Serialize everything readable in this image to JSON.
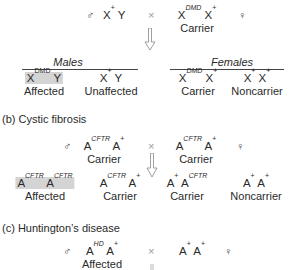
{
  "panel_a": {
    "male_symbol": "♂",
    "female_symbol": "♀",
    "cross": "×",
    "father": {
      "base1": "X",
      "sup1": "+",
      "base2": "Y",
      "sup2": ""
    },
    "mother": {
      "base1": "X",
      "sup1": "DMD",
      "base2": "X",
      "sup2": "+",
      "label": "Carrier"
    },
    "males_header": "Males",
    "females_header": "Females",
    "offspring": [
      {
        "base1": "X",
        "sup1": "DMD",
        "base2": "Y",
        "sup2": "",
        "label": "Affected",
        "highlighted": true
      },
      {
        "base1": "X",
        "sup1": "+",
        "base2": "Y",
        "sup2": "",
        "label": "Unaffected",
        "highlighted": false
      },
      {
        "base1": "X",
        "sup1": "DMD",
        "base2": "X",
        "sup2": "+",
        "label": "Carrier",
        "highlighted": false
      },
      {
        "base1": "X",
        "sup1": "+",
        "base2": "X",
        "sup2": "+",
        "label": "Noncarrier",
        "highlighted": false
      }
    ]
  },
  "panel_b": {
    "title": "(b) Cystic fibrosis",
    "male_symbol": "♂",
    "female_symbol": "♀",
    "cross": "×",
    "father": {
      "base1": "A",
      "sup1": "CFTR",
      "base2": "A",
      "sup2": "+",
      "label": "Carrier"
    },
    "mother": {
      "base1": "A",
      "sup1": "CFTR",
      "base2": "A",
      "sup2": "+",
      "label": "Carrier"
    },
    "offspring": [
      {
        "base1": "A",
        "sup1": "CFTR",
        "base2": "A",
        "sup2": "CFTR",
        "label": "Affected",
        "highlighted": true
      },
      {
        "base1": "A",
        "sup1": "CFTR",
        "base2": "A",
        "sup2": "+",
        "label": "Carrier",
        "highlighted": false
      },
      {
        "base1": "A",
        "sup1": "+",
        "base2": "A",
        "sup2": "CFTR",
        "label": "Carrier",
        "highlighted": false
      },
      {
        "base1": "A",
        "sup1": "+",
        "base2": "A",
        "sup2": "+",
        "label": "Noncarrier",
        "highlighted": false
      }
    ]
  },
  "panel_c": {
    "title": "(c) Huntington’s disease",
    "male_symbol": "♂",
    "female_symbol": "♀",
    "cross": "×",
    "father": {
      "base1": "A",
      "sup1": "HD",
      "base2": "A",
      "sup2": "+",
      "label": "Affected"
    },
    "mother": {
      "base1": "A",
      "sup1": "+",
      "base2": "A",
      "sup2": "+"
    }
  }
}
